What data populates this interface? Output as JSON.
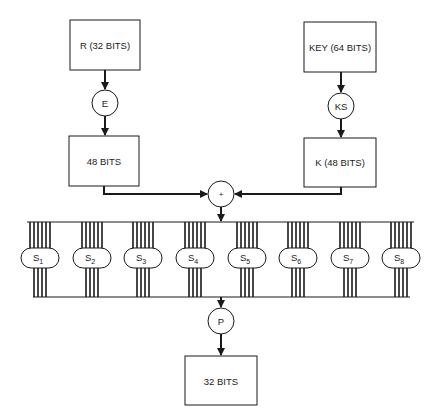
{
  "diagram": {
    "title": "",
    "boxes": {
      "r_input": "R (32 BITS)",
      "key_input": "KEY (64 BITS)",
      "expanded": "48 BITS",
      "subkey": "K (48 BITS)",
      "output": "32 BITS"
    },
    "nodes": {
      "expansion": "E",
      "key_schedule": "KS",
      "xor": "+",
      "permutation": "P"
    },
    "sboxes": [
      {
        "base": "S",
        "sub": "1"
      },
      {
        "base": "S",
        "sub": "2"
      },
      {
        "base": "S",
        "sub": "3"
      },
      {
        "base": "S",
        "sub": "4"
      },
      {
        "base": "S",
        "sub": "5"
      },
      {
        "base": "S",
        "sub": "6"
      },
      {
        "base": "S",
        "sub": "7"
      },
      {
        "base": "S",
        "sub": "8"
      }
    ],
    "sbox_inputs_per_box": 6,
    "sbox_outputs_per_box": 4,
    "colors": {
      "stroke": "#1a1a1a",
      "background": "#ffffff",
      "text": "#222222"
    }
  }
}
